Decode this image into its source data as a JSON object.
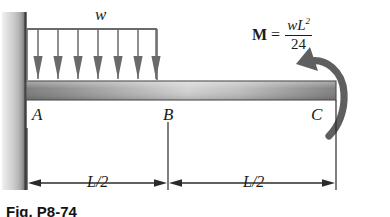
{
  "figure": {
    "caption": "Fig. P8-74",
    "labels": {
      "load": "w",
      "point_a": "A",
      "point_b": "B",
      "point_c": "C"
    },
    "moment": {
      "symbol": "M",
      "equals": "=",
      "numerator": "wL",
      "numerator_exponent": "2",
      "denominator": "24",
      "direction": "counterclockwise"
    },
    "dimensions": {
      "left_span": "L/2",
      "right_span": "L/2"
    },
    "icons": {
      "fixed_support": "wall-hatch-icon",
      "distributed_load": "down-arrow-icon",
      "moment_arrow": "curved-arrow-icon"
    },
    "colors": {
      "ink": "#1b1b1b",
      "beam_dark": "#6f6f6f",
      "beam_light": "#cfcfcf",
      "wall_light": "#e8e8e8",
      "wall_dark": "#555555",
      "arrow_gray": "#6a6a6a",
      "background": "#ffffff"
    },
    "load_arrow_count": 7
  }
}
